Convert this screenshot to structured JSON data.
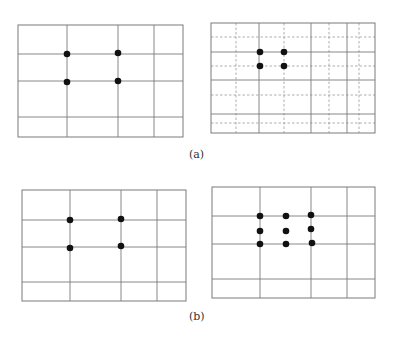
{
  "figure": {
    "captions": {
      "a": "(a)",
      "b": "(b)"
    },
    "colors": {
      "grid_line": "#7a7a7a",
      "dashed_line": "#9a9a9a",
      "dot": "#111111",
      "background": "#ffffff"
    },
    "panels": [
      {
        "id": "a-left",
        "description": "Rule-of-thirds style grid with 4 focus points at inner intersections",
        "frame": {
          "x1": 18,
          "y1": 25,
          "x2": 183,
          "y2": 137
        },
        "solid_verticals": [
          67,
          118,
          154
        ],
        "solid_horizontals": [
          54,
          81,
          117
        ],
        "dashed_verticals": [],
        "dashed_horizontals": [],
        "dots": [
          [
            67,
            54
          ],
          [
            118,
            53
          ],
          [
            67,
            82
          ],
          [
            118,
            81
          ]
        ]
      },
      {
        "id": "a-right",
        "description": "Grid with additional dashed subdivision lines and 4 closely spaced focus points",
        "frame": {
          "x1": 211,
          "y1": 23,
          "x2": 375,
          "y2": 133
        },
        "solid_verticals": [
          259,
          311,
          347
        ],
        "solid_horizontals": [
          52,
          80,
          114
        ],
        "dashed_verticals": [
          236,
          284,
          329,
          359
        ],
        "dashed_horizontals": [
          37,
          66,
          95,
          123
        ],
        "dots": [
          [
            260,
            52
          ],
          [
            284,
            52
          ],
          [
            260,
            66
          ],
          [
            284,
            66
          ]
        ]
      },
      {
        "id": "b-left",
        "description": "Grid with 4 focus points at inner intersections",
        "frame": {
          "x1": 22,
          "y1": 190,
          "x2": 186,
          "y2": 301
        },
        "solid_verticals": [
          70,
          121,
          157
        ],
        "solid_horizontals": [
          220,
          247,
          282
        ],
        "dashed_verticals": [],
        "dashed_horizontals": [],
        "dots": [
          [
            70,
            220
          ],
          [
            121,
            219
          ],
          [
            70,
            248
          ],
          [
            121,
            246
          ]
        ]
      },
      {
        "id": "b-right",
        "description": "Grid with 3x3 array of 9 focus points",
        "frame": {
          "x1": 212,
          "y1": 187,
          "x2": 375,
          "y2": 298
        },
        "solid_verticals": [
          260,
          311,
          347
        ],
        "solid_horizontals": [
          216,
          244,
          279
        ],
        "dashed_verticals": [],
        "dashed_horizontals": [],
        "dots": [
          [
            260,
            216
          ],
          [
            286,
            216
          ],
          [
            311,
            215
          ],
          [
            260,
            231
          ],
          [
            286,
            231
          ],
          [
            311,
            229
          ],
          [
            260,
            244
          ],
          [
            286,
            244
          ],
          [
            312,
            243
          ]
        ]
      }
    ]
  }
}
